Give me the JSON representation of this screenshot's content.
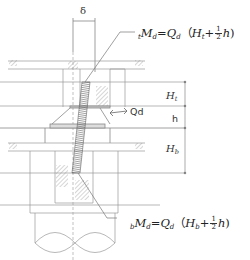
{
  "diagram": {
    "labels": {
      "delta": "δ",
      "shear": "Qd",
      "dim_top": {
        "main": "H",
        "sub": "t"
      },
      "dim_mid": "h",
      "dim_bottom": {
        "main": "H",
        "sub": "b"
      }
    },
    "formula_top": {
      "prefix": "t",
      "lhs_main": "M",
      "lhs_sub": "d",
      "equals": "=",
      "q_main": "Q",
      "q_sub": "d",
      "open": "（",
      "h_main": "H",
      "h_sub": "t",
      "plus": "+",
      "frac_num": "1",
      "frac_den": "2",
      "h_var": "h",
      "close": ")"
    },
    "formula_bottom": {
      "prefix": "b",
      "lhs_main": "M",
      "lhs_sub": "d",
      "equals": "=",
      "q_main": "Q",
      "q_sub": "d",
      "open": "（",
      "h_main": "H",
      "h_sub": "b",
      "plus": "+",
      "frac_num": "1",
      "frac_den": "2",
      "h_var": "h",
      "close": ")"
    },
    "colors": {
      "line": "#8a8a8a",
      "dark_line": "#555555",
      "moment_fill": "#777777"
    }
  }
}
